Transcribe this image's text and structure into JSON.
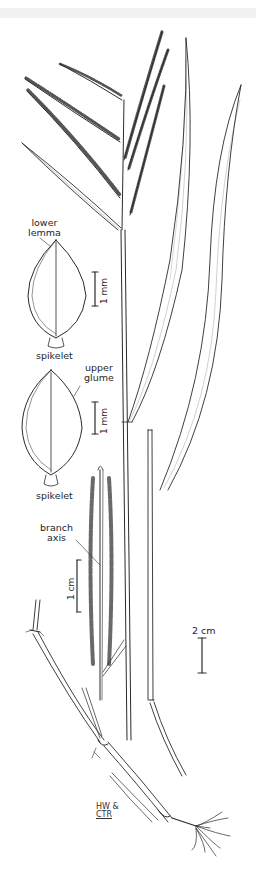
{
  "plate": {
    "subject": "grass plant illustration (panicle, leaves, culm, roots, spikelet details)",
    "ink_color": "#2a2a2a",
    "background": "#ffffff",
    "top_strip_color": "#f1f1f1"
  },
  "labels": {
    "lower_lemma_line1": "lower",
    "lower_lemma_line2": "lemma",
    "spikelet_1": "spikelet",
    "upper_glume_line1": "upper",
    "upper_glume_line2": "glume",
    "spikelet_2": "spikelet",
    "branch_axis_line1": "branch",
    "branch_axis_line2": "axis"
  },
  "scale_bars": {
    "lower_lemma_scale": "1 mm",
    "upper_glume_scale": "1 mm",
    "branch_scale": "1 cm",
    "habit_scale": "2 cm"
  },
  "signature": {
    "line1": "HW &",
    "line2": "CTR"
  }
}
